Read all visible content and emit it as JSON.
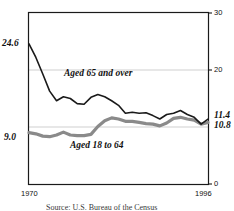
{
  "chart_data": {
    "type": "line",
    "title": "",
    "xlabel": "",
    "ylabel": "",
    "xlim": [
      1970,
      1996
    ],
    "ylim": [
      0,
      30
    ],
    "yticks": [
      "0",
      "20",
      "30"
    ],
    "ytick_values": [
      0,
      20,
      30
    ],
    "xticks": [
      "1970",
      "1996"
    ],
    "xtick_values": [
      1970,
      1996
    ],
    "gridlines": [
      10,
      20
    ],
    "grid": true,
    "legend_position": "inline-annotation",
    "axis_side": "right",
    "x": [
      1970,
      1971,
      1972,
      1973,
      1974,
      1975,
      1976,
      1977,
      1978,
      1979,
      1980,
      1981,
      1982,
      1983,
      1984,
      1985,
      1986,
      1987,
      1988,
      1989,
      1990,
      1991,
      1992,
      1993,
      1994,
      1995,
      1996
    ],
    "series": [
      {
        "name": "Aged 65 and over",
        "color": "#1a1a1a",
        "width": 1.6,
        "start_label": "24.6",
        "end_label": "11.4",
        "values": [
          24.6,
          22.2,
          19.3,
          16.3,
          14.6,
          15.3,
          15.0,
          14.1,
          14.0,
          15.2,
          15.7,
          15.3,
          14.6,
          13.8,
          12.4,
          12.6,
          12.4,
          12.5,
          12.0,
          11.4,
          12.2,
          12.4,
          12.9,
          12.2,
          11.7,
          10.5,
          11.4
        ]
      },
      {
        "name": "Aged 18 to 64",
        "color": "#8a8a8a",
        "width": 3.2,
        "start_label": "9.0",
        "end_label": "10.8",
        "values": [
          9.0,
          8.8,
          8.4,
          8.3,
          8.6,
          9.1,
          8.6,
          8.5,
          8.5,
          8.7,
          10.1,
          11.1,
          11.6,
          11.4,
          11.0,
          11.0,
          10.8,
          10.6,
          10.5,
          10.2,
          10.7,
          11.5,
          11.7,
          11.4,
          11.2,
          10.5,
          10.8
        ]
      }
    ]
  },
  "annotations": {
    "left_top_value": "24.6",
    "left_bottom_value": "9.0",
    "right_top_value": "11.4",
    "right_bottom_value": "10.8",
    "series_one_label": "Aged 65 and over",
    "series_two_label": "Aged 18 to 64"
  },
  "axis": {
    "y_tick_30": "30",
    "y_tick_20": "20",
    "y_tick_0": "0",
    "x_tick_start": "1970",
    "x_tick_end": "1996"
  },
  "footer": {
    "source": "Source: U.S. Bureau of the Census"
  },
  "colors": {
    "series_one": "#1a1a1a",
    "series_two": "#8a8a8a",
    "grid": "#c9c9c9",
    "frame": "#1a1a1a",
    "background": "#ffffff"
  }
}
